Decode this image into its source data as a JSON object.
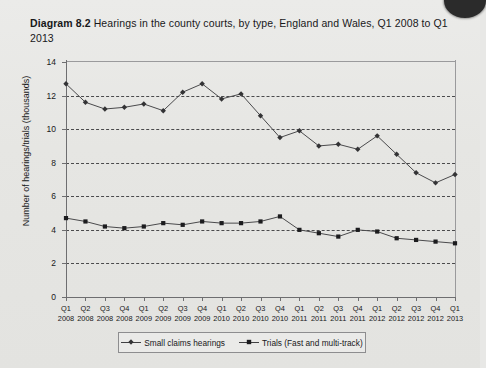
{
  "figure": {
    "number_label": "Diagram 8.2",
    "title": "Hearings in the county courts, by type, England and Wales, Q1 2008 to Q1 2013"
  },
  "chart_data": {
    "type": "line",
    "title": "Hearings in the county courts, by type, England and Wales, Q1 2008 to Q1 2013",
    "xlabel": "",
    "ylabel": "Number of hearings/trials (thousands)",
    "ylim": [
      0,
      14
    ],
    "ytick_values": [
      0,
      2,
      4,
      6,
      8,
      10,
      12,
      14
    ],
    "ytick_labels": [
      "0",
      "2",
      "4",
      "6",
      "8",
      "10",
      "12",
      "14"
    ],
    "grid": "horizontal-dashed",
    "legend_position": "bottom",
    "categories": [
      "Q1 2008",
      "Q2 2008",
      "Q3 2008",
      "Q4 2008",
      "Q1 2009",
      "Q2 2009",
      "Q3 2009",
      "Q4 2009",
      "Q1 2010",
      "Q2 2010",
      "Q3 2010",
      "Q4 2010",
      "Q1 2011",
      "Q2 2011",
      "Q3 2011",
      "Q4 2011",
      "Q1 2012",
      "Q2 2012",
      "Q3 2012",
      "Q4 2012",
      "Q1 2013"
    ],
    "categories_quarter": [
      "Q1",
      "Q2",
      "Q3",
      "Q4",
      "Q1",
      "Q2",
      "Q3",
      "Q4",
      "Q1",
      "Q2",
      "Q3",
      "Q4",
      "Q1",
      "Q2",
      "Q3",
      "Q4",
      "Q1",
      "Q2",
      "Q3",
      "Q4",
      "Q1"
    ],
    "categories_year": [
      "2008",
      "2008",
      "2008",
      "2008",
      "2009",
      "2009",
      "2009",
      "2009",
      "2010",
      "2010",
      "2010",
      "2010",
      "2011",
      "2011",
      "2011",
      "2011",
      "2012",
      "2012",
      "2012",
      "2012",
      "2013"
    ],
    "series": [
      {
        "name": "Small claims hearings",
        "marker": "diamond",
        "color": "#333335",
        "values": [
          12.7,
          11.6,
          11.2,
          11.3,
          11.5,
          11.1,
          12.2,
          12.7,
          11.8,
          12.1,
          10.8,
          9.5,
          9.9,
          9.0,
          9.1,
          8.8,
          9.6,
          8.5,
          7.4,
          6.8,
          7.3
        ]
      },
      {
        "name": "Trials (Fast and multi-track)",
        "marker": "square",
        "color": "#1c1c1e",
        "values": [
          4.7,
          4.5,
          4.2,
          4.1,
          4.2,
          4.4,
          4.3,
          4.5,
          4.4,
          4.4,
          4.5,
          4.8,
          4.0,
          3.8,
          3.6,
          4.0,
          3.9,
          3.5,
          3.4,
          3.3,
          3.2
        ]
      }
    ]
  }
}
